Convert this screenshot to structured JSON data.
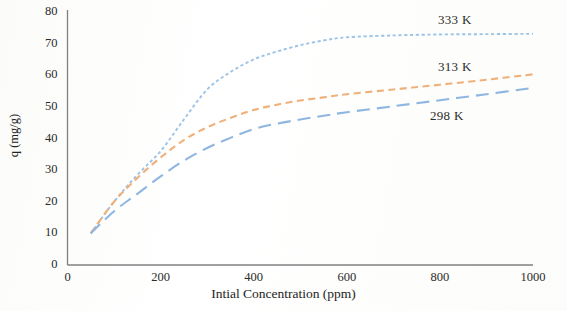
{
  "chart_data": {
    "type": "line",
    "title": "",
    "subtitle": "",
    "xlabel": "Intial Concentration (ppm)",
    "ylabel": "q (mg/g)",
    "xlim": [
      0,
      1000
    ],
    "ylim": [
      0,
      80
    ],
    "xticks": [
      "0",
      "200",
      "400",
      "600",
      "800",
      "1000"
    ],
    "xtick_values": [
      0,
      200,
      400,
      600,
      800,
      1000
    ],
    "yticks": [
      "0",
      "10",
      "20",
      "30",
      "40",
      "50",
      "60",
      "70",
      "80"
    ],
    "ytick_values": [
      0,
      10,
      20,
      30,
      40,
      50,
      60,
      70,
      80
    ],
    "grid": false,
    "legend_position": "inline-right-annotations",
    "x": [
      50,
      100,
      150,
      200,
      250,
      300,
      350,
      400,
      450,
      500,
      550,
      600,
      700,
      800,
      900,
      1000
    ],
    "series": [
      {
        "name": "333 K",
        "color": "#9dc3e6",
        "dash": "dotted",
        "values": [
          10,
          20,
          28.5,
          36,
          46,
          55.5,
          61,
          65,
          67.5,
          69.5,
          71,
          72,
          72.6,
          72.9,
          73,
          73.1
        ]
      },
      {
        "name": "313 K",
        "color": "#f0b07a",
        "dash": "dashed",
        "values": [
          10,
          20,
          27.5,
          34,
          39.5,
          43.5,
          46.5,
          49,
          50.7,
          52,
          53,
          54,
          55.5,
          57,
          58.6,
          60.3
        ]
      },
      {
        "name": "298 K",
        "color": "#8fb6e0",
        "dash": "long-dash",
        "values": [
          10,
          17,
          22.5,
          28,
          33,
          37,
          40.2,
          43,
          44.7,
          46,
          47.2,
          48.3,
          50.2,
          52.1,
          54,
          56
        ]
      }
    ],
    "annotations": [
      {
        "text": "333 K",
        "series": "333 K"
      },
      {
        "text": "313 K",
        "series": "313 K"
      },
      {
        "text": "298 K",
        "series": "298 K"
      }
    ]
  },
  "colors": {
    "axis": "#808080",
    "text": "#2b2b2b",
    "background": "#fdfdfc"
  }
}
